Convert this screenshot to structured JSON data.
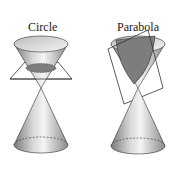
{
  "figure": {
    "panels": [
      {
        "id": "circle",
        "label": "Circle",
        "section_type": "horizontal plane"
      },
      {
        "id": "parabola",
        "label": "Parabola",
        "section_type": "plane parallel to cone side"
      }
    ],
    "colors": {
      "cone_light": "#f2f2f2",
      "cone_dark": "#8a8a8a",
      "section_fill": "#7d7d7d",
      "outline": "#333333"
    }
  }
}
